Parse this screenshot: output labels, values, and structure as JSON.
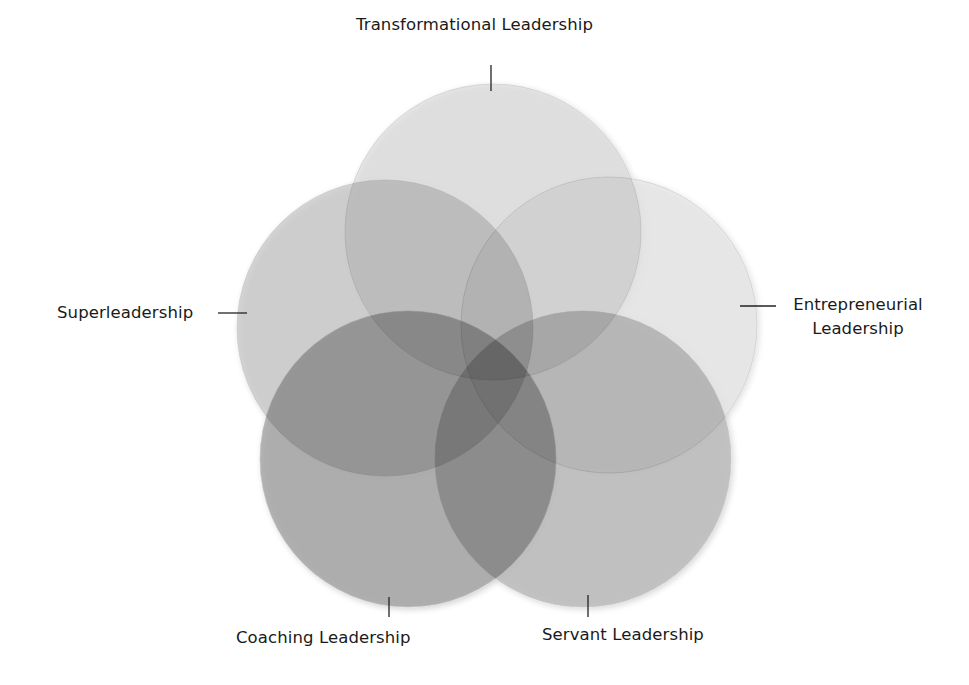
{
  "diagram": {
    "type": "five-circle-venn",
    "circles": [
      {
        "id": "transformational",
        "label": "Transformational Leadership",
        "cx": 493,
        "cy": 232,
        "r": 148,
        "fill": "#d6d6d6",
        "opacity": 0.6
      },
      {
        "id": "superleadership",
        "label": "Superleadership",
        "cx": 385,
        "cy": 328,
        "r": 148,
        "fill": "#bdbdbd",
        "opacity": 0.62
      },
      {
        "id": "entrepreneurial",
        "label": "Entrepreneurial Leadership",
        "cx": 609,
        "cy": 325,
        "r": 148,
        "fill": "#d9d9d9",
        "opacity": 0.45
      },
      {
        "id": "coaching",
        "label": "Coaching Leadership",
        "cx": 408,
        "cy": 459,
        "r": 148,
        "fill": "#9a9a9a",
        "opacity": 0.72
      },
      {
        "id": "servant",
        "label": "Servant Leadership",
        "cx": 583,
        "cy": 459,
        "r": 148,
        "fill": "#a9a9a9",
        "opacity": 0.62
      }
    ],
    "labels": {
      "transformational": "Transformational Leadership",
      "superleadership": "Superleadership",
      "entrepreneurial_line1": "Entrepreneurial",
      "entrepreneurial_line2": "Leadership",
      "coaching": "Coaching Leadership",
      "servant": "Servant Leadership"
    },
    "leader_line_color": "#222222"
  }
}
